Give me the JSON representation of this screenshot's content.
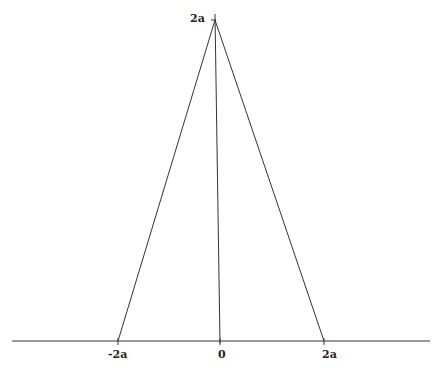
{
  "diagram": {
    "type": "triangle-function-graph",
    "stroke_color": "#333333",
    "background": "#ffffff",
    "axes": {
      "x_axis": {
        "from": [
          12,
          341
        ],
        "to": [
          430,
          341
        ]
      },
      "y_axis": {
        "from": [
          215,
          14
        ],
        "to": [
          220,
          343
        ]
      }
    },
    "triangle": {
      "apex": [
        215,
        20
      ],
      "left_base": [
        118,
        341
      ],
      "right_base": [
        324,
        341
      ]
    },
    "x_ticks": [
      {
        "label": "-2a",
        "x": 118,
        "label_x": 108
      },
      {
        "label": "0",
        "x": 220,
        "label_x": 218
      },
      {
        "label": "2a",
        "x": 324,
        "label_x": 322
      }
    ],
    "y_ticks": [
      {
        "label": "2a",
        "y": 20,
        "label_x": 190
      }
    ]
  }
}
